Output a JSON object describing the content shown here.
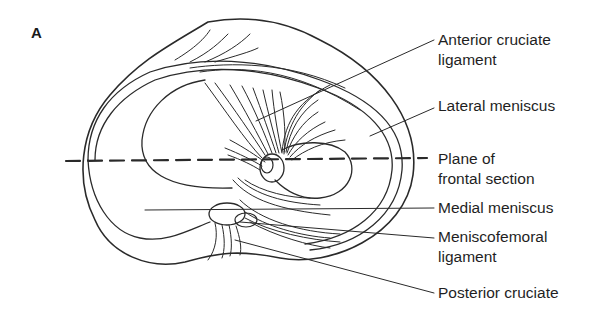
{
  "figure": {
    "panel_label": "A",
    "labels": {
      "acl_line1": "Anterior cruciate",
      "acl_line2": "ligament",
      "lateral_meniscus": "Lateral meniscus",
      "plane_line1": "Plane of",
      "plane_line2": "frontal section",
      "medial_meniscus": "Medial meniscus",
      "mfl_line1": "Meniscofemoral",
      "mfl_line2": "ligament",
      "posterior_cruciate": "Posterior cruciate"
    },
    "colors": {
      "stroke": "#2a2a2a",
      "text": "#1f1f1f",
      "background": "#ffffff"
    }
  }
}
